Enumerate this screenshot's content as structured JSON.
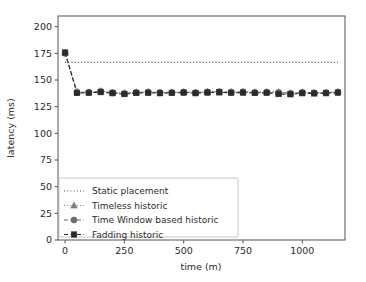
{
  "chart_data": {
    "type": "line",
    "title": "",
    "xlabel": "time (m)",
    "ylabel": "latency (ms)",
    "xlim": [
      -30,
      1180
    ],
    "ylim": [
      0,
      210
    ],
    "xticks": [
      0,
      250,
      500,
      750,
      1000
    ],
    "yticks": [
      0,
      25,
      50,
      75,
      100,
      125,
      150,
      175,
      200
    ],
    "xticklabels": [
      "0",
      "250",
      "500",
      "750",
      "1000"
    ],
    "yticklabels": [
      "0",
      "25",
      "50",
      "75",
      "100",
      "125",
      "150",
      "175",
      "200"
    ],
    "grid": false,
    "legend_position": "lower left",
    "x": [
      0,
      50,
      100,
      150,
      200,
      250,
      300,
      350,
      400,
      450,
      500,
      550,
      600,
      650,
      700,
      750,
      800,
      850,
      900,
      950,
      1000,
      1050,
      1100,
      1150
    ],
    "series": [
      {
        "name": "Static placement",
        "style": "dotted",
        "marker": "none",
        "color": "#4a4a4a",
        "values": [
          166.5,
          166.5,
          166.5,
          166.5,
          166.5,
          166.5,
          166.5,
          166.5,
          166.5,
          166.5,
          166.5,
          166.5,
          166.5,
          166.5,
          166.5,
          166.5,
          166.5,
          166.5,
          166.5,
          166.5,
          166.5,
          166.5,
          166.5,
          166.5
        ]
      },
      {
        "name": "Timeless historic",
        "style": "dotted",
        "marker": "triangle",
        "color": "#7d7d7d",
        "values": [
          175.5,
          139.0,
          138.6,
          139.6,
          138.4,
          137.6,
          138.6,
          138.8,
          138.4,
          138.6,
          138.8,
          138.4,
          139.0,
          139.2,
          138.8,
          139.0,
          138.6,
          138.8,
          138.6,
          137.6,
          138.6,
          138.2,
          138.4,
          138.8
        ]
      },
      {
        "name": "Time Window based historic",
        "style": "dashed",
        "marker": "circle",
        "color": "#6e6e6e",
        "values": [
          175.0,
          138.6,
          138.4,
          139.4,
          138.2,
          137.4,
          138.4,
          138.6,
          138.2,
          138.4,
          138.6,
          138.2,
          138.8,
          139.0,
          138.6,
          138.8,
          138.4,
          138.6,
          138.4,
          137.4,
          138.4,
          138.0,
          138.2,
          138.6
        ]
      },
      {
        "name": "Fadding historic",
        "style": "dashed",
        "marker": "square",
        "color": "#2b2b2b",
        "values": [
          175.8,
          137.8,
          138.0,
          138.6,
          137.6,
          136.8,
          137.8,
          138.0,
          137.6,
          137.8,
          138.2,
          137.6,
          138.2,
          138.4,
          138.0,
          138.2,
          137.8,
          138.0,
          136.8,
          136.6,
          137.6,
          137.4,
          137.6,
          138.2
        ]
      }
    ]
  }
}
